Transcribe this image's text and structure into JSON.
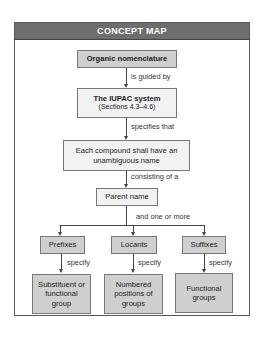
{
  "header": {
    "title": "CONCEPT MAP"
  },
  "nodes": {
    "organic": "Organic nomenclature",
    "iupac_title": "The IUPAC system",
    "iupac_sub": "(Sections 4.3–4.6)",
    "each_compound": "Each compound shall have an unambiguous name",
    "parent": "Parent name",
    "prefixes": "Prefixes",
    "locants": "Locants",
    "suffixes": "Suffixes",
    "substituent": "Substituent or functional group",
    "numbered": "Numbered positions of groups",
    "functional": "Functional groups"
  },
  "links": {
    "guided": "is guided by",
    "specifies": "specifies that",
    "consisting": "consisting of a",
    "and_more": "and one or more",
    "specify_1": "specify",
    "specify_2": "specify",
    "specify_3": "specify"
  },
  "colors": {
    "header": "#6e6e6e",
    "dark_box": "#cfcfcf",
    "light_box": "#f2f2f2"
  }
}
